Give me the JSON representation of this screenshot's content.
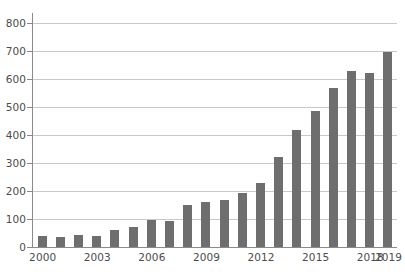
{
  "chart_data": {
    "type": "bar",
    "title": "",
    "subtitle": "",
    "xlabel": "",
    "ylabel": "",
    "categories": [
      "2000",
      "2001",
      "2002",
      "2003",
      "2004",
      "2005",
      "2006",
      "2007",
      "2008",
      "2009",
      "2010",
      "2011",
      "2012",
      "2013",
      "2014",
      "2015",
      "2016",
      "2017",
      "2018",
      "2019"
    ],
    "values": [
      40,
      35,
      43,
      40,
      62,
      73,
      98,
      94,
      150,
      160,
      168,
      192,
      228,
      322,
      418,
      484,
      567,
      628,
      620,
      695
    ],
    "series": [
      {
        "name": "",
        "values": [
          40,
          35,
          43,
          40,
          62,
          73,
          98,
          94,
          150,
          160,
          168,
          192,
          228,
          322,
          418,
          484,
          567,
          628,
          620,
          695
        ]
      }
    ],
    "ylim": [
      0,
      800
    ],
    "y_ticks": [
      0,
      100,
      200,
      300,
      400,
      500,
      600,
      700,
      800
    ],
    "y_tick_labels": [
      "0",
      "100",
      "200",
      "300",
      "400",
      "500",
      "600",
      "700",
      "800"
    ],
    "x_tick_labels": [
      "2000",
      "2003",
      "2006",
      "2009",
      "2012",
      "2015",
      "2018",
      "2019"
    ],
    "x_tick_indices": [
      0,
      3,
      6,
      9,
      12,
      15,
      18,
      19
    ],
    "grid": true,
    "grid_axis": "y",
    "legend": false,
    "legend_position": "none",
    "colors": {
      "bar": "#6e6e6e",
      "gridline": "#c8c8c8",
      "axis": "#8a8a8a",
      "text": "#4c4c4c",
      "background": "#ffffff"
    }
  }
}
